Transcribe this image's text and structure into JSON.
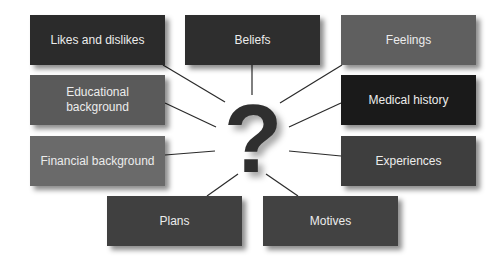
{
  "center": {
    "symbol": "?",
    "color": "#2f2f2f"
  },
  "boxes": [
    {
      "id": "likes",
      "label": "Likes and dislikes",
      "color": "#2b2b2b",
      "x": 30,
      "y": 15
    },
    {
      "id": "beliefs",
      "label": "Beliefs",
      "color": "#2e2e2e",
      "x": 185,
      "y": 15
    },
    {
      "id": "feelings",
      "label": "Feelings",
      "color": "#5f5f5f",
      "x": 341,
      "y": 15
    },
    {
      "id": "education",
      "label": "Educational background",
      "color": "#5a5a5a",
      "x": 30,
      "y": 75
    },
    {
      "id": "medical",
      "label": "Medical history",
      "color": "#1a1a1a",
      "x": 341,
      "y": 75
    },
    {
      "id": "financial",
      "label": "Financial background",
      "color": "#6a6a6a",
      "x": 30,
      "y": 136
    },
    {
      "id": "experiences",
      "label": "Experiences",
      "color": "#3e3e3e",
      "x": 341,
      "y": 136
    },
    {
      "id": "plans",
      "label": "Plans",
      "color": "#404040",
      "x": 107,
      "y": 196
    },
    {
      "id": "motives",
      "label": "Motives",
      "color": "#424242",
      "x": 263,
      "y": 196
    }
  ],
  "connectors": [
    {
      "from": "likes",
      "x1": 163,
      "y1": 65,
      "x2": 225,
      "y2": 102
    },
    {
      "from": "beliefs",
      "x1": 252,
      "y1": 65,
      "x2": 252,
      "y2": 95
    },
    {
      "from": "feelings",
      "x1": 342,
      "y1": 65,
      "x2": 280,
      "y2": 103
    },
    {
      "from": "education",
      "x1": 165,
      "y1": 103,
      "x2": 216,
      "y2": 127
    },
    {
      "from": "medical",
      "x1": 341,
      "y1": 103,
      "x2": 289,
      "y2": 127
    },
    {
      "from": "financial",
      "x1": 165,
      "y1": 155,
      "x2": 215,
      "y2": 151
    },
    {
      "from": "experiences",
      "x1": 341,
      "y1": 156,
      "x2": 289,
      "y2": 151
    },
    {
      "from": "plans",
      "x1": 207,
      "y1": 196,
      "x2": 238,
      "y2": 174
    },
    {
      "from": "motives",
      "x1": 298,
      "y1": 196,
      "x2": 266,
      "y2": 174
    }
  ]
}
